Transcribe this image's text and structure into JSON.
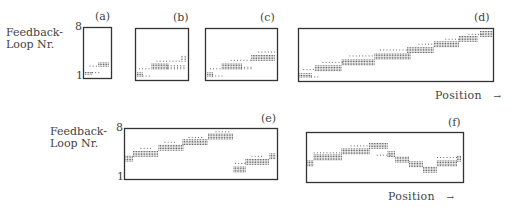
{
  "chart_data": {
    "type": "scatter",
    "title": "",
    "ylabel": "Feedback-Loop Nr.",
    "xlabel": "Position →",
    "ylim": [
      1,
      8
    ],
    "y_ticks": [
      "1",
      "8"
    ],
    "panels": [
      {
        "label": "(a)",
        "box": [
          83,
          27,
          28,
          51
        ],
        "blocks": [
          {
            "x0": 0.02,
            "x1": 0.3,
            "level": 0.05,
            "rows": 2,
            "dense": true
          },
          {
            "x0": 0.3,
            "x1": 0.65,
            "level": 0.08,
            "rows": 1,
            "dense": false
          },
          {
            "x0": 0.55,
            "x1": 0.98,
            "level": 0.22,
            "rows": 3,
            "dense": true
          },
          {
            "x0": 0.2,
            "x1": 0.5,
            "level": 0.22,
            "rows": 1,
            "dense": false
          }
        ]
      },
      {
        "label": "(b)",
        "box": [
          135,
          28,
          53,
          52
        ],
        "blocks": [
          {
            "x0": 0.01,
            "x1": 0.12,
            "level": 0.05,
            "rows": 3,
            "dense": true
          },
          {
            "x0": 0.12,
            "x1": 0.3,
            "level": 0.05,
            "rows": 1,
            "dense": false
          },
          {
            "x0": 0.05,
            "x1": 0.3,
            "level": 0.2,
            "rows": 1,
            "dense": false
          },
          {
            "x0": 0.3,
            "x1": 0.62,
            "level": 0.2,
            "rows": 4,
            "dense": true
          },
          {
            "x0": 0.62,
            "x1": 0.99,
            "level": 0.2,
            "rows": 3,
            "dense": false
          },
          {
            "x0": 0.4,
            "x1": 0.9,
            "level": 0.36,
            "rows": 1,
            "dense": false
          },
          {
            "x0": 0.9,
            "x1": 0.99,
            "level": 0.36,
            "rows": 4,
            "dense": false
          }
        ]
      },
      {
        "label": "(c)",
        "box": [
          205,
          28,
          72,
          52
        ],
        "blocks": [
          {
            "x0": 0.01,
            "x1": 0.08,
            "level": 0.05,
            "rows": 3,
            "dense": true
          },
          {
            "x0": 0.08,
            "x1": 0.25,
            "level": 0.05,
            "rows": 1,
            "dense": false
          },
          {
            "x0": 0.05,
            "x1": 0.22,
            "level": 0.2,
            "rows": 1,
            "dense": false
          },
          {
            "x0": 0.22,
            "x1": 0.5,
            "level": 0.2,
            "rows": 4,
            "dense": true
          },
          {
            "x0": 0.5,
            "x1": 0.68,
            "level": 0.2,
            "rows": 2,
            "dense": false
          },
          {
            "x0": 0.35,
            "x1": 0.65,
            "level": 0.38,
            "rows": 1,
            "dense": false
          },
          {
            "x0": 0.65,
            "x1": 0.99,
            "level": 0.38,
            "rows": 4,
            "dense": true
          },
          {
            "x0": 0.75,
            "x1": 0.99,
            "level": 0.55,
            "rows": 1,
            "dense": false
          }
        ]
      },
      {
        "label": "(d)",
        "box": [
          298,
          28,
          195,
          53
        ],
        "blocks": [
          {
            "x0": 0.0,
            "x1": 0.06,
            "level": 0.05,
            "rows": 3,
            "dense": true
          },
          {
            "x0": 0.06,
            "x1": 0.1,
            "level": 0.05,
            "rows": 1,
            "dense": false
          },
          {
            "x0": 0.02,
            "x1": 0.08,
            "level": 0.2,
            "rows": 1,
            "dense": false
          },
          {
            "x0": 0.08,
            "x1": 0.22,
            "level": 0.18,
            "rows": 4,
            "dense": true
          },
          {
            "x0": 0.12,
            "x1": 0.22,
            "level": 0.35,
            "rows": 1,
            "dense": false
          },
          {
            "x0": 0.22,
            "x1": 0.39,
            "level": 0.3,
            "rows": 4,
            "dense": true
          },
          {
            "x0": 0.26,
            "x1": 0.39,
            "level": 0.48,
            "rows": 1,
            "dense": false
          },
          {
            "x0": 0.39,
            "x1": 0.58,
            "level": 0.42,
            "rows": 4,
            "dense": true
          },
          {
            "x0": 0.42,
            "x1": 0.56,
            "level": 0.6,
            "rows": 1,
            "dense": false
          },
          {
            "x0": 0.56,
            "x1": 0.7,
            "level": 0.55,
            "rows": 4,
            "dense": true
          },
          {
            "x0": 0.62,
            "x1": 0.7,
            "level": 0.72,
            "rows": 1,
            "dense": false
          },
          {
            "x0": 0.7,
            "x1": 0.83,
            "level": 0.67,
            "rows": 4,
            "dense": true
          },
          {
            "x0": 0.76,
            "x1": 0.83,
            "level": 0.82,
            "rows": 1,
            "dense": false
          },
          {
            "x0": 0.83,
            "x1": 0.93,
            "level": 0.78,
            "rows": 4,
            "dense": true
          },
          {
            "x0": 0.88,
            "x1": 0.95,
            "level": 0.92,
            "rows": 1,
            "dense": false
          },
          {
            "x0": 0.94,
            "x1": 1.0,
            "level": 0.88,
            "rows": 4,
            "dense": true
          }
        ]
      },
      {
        "label": "(e)",
        "box": [
          124,
          128,
          153,
          51
        ],
        "blocks": [
          {
            "x0": 0.0,
            "x1": 0.05,
            "level": 0.35,
            "rows": 4,
            "dense": true
          },
          {
            "x0": 0.05,
            "x1": 0.22,
            "level": 0.45,
            "rows": 4,
            "dense": true
          },
          {
            "x0": 0.1,
            "x1": 0.18,
            "level": 0.62,
            "rows": 1,
            "dense": false
          },
          {
            "x0": 0.22,
            "x1": 0.38,
            "level": 0.58,
            "rows": 4,
            "dense": true
          },
          {
            "x0": 0.26,
            "x1": 0.34,
            "level": 0.75,
            "rows": 1,
            "dense": false
          },
          {
            "x0": 0.38,
            "x1": 0.55,
            "level": 0.7,
            "rows": 4,
            "dense": true
          },
          {
            "x0": 0.42,
            "x1": 0.52,
            "level": 0.85,
            "rows": 1,
            "dense": false
          },
          {
            "x0": 0.55,
            "x1": 0.72,
            "level": 0.82,
            "rows": 4,
            "dense": true
          },
          {
            "x0": 0.6,
            "x1": 0.7,
            "level": 0.97,
            "rows": 1,
            "dense": false
          },
          {
            "x0": 0.72,
            "x1": 0.8,
            "level": 0.12,
            "rows": 4,
            "dense": true
          },
          {
            "x0": 0.73,
            "x1": 0.8,
            "level": 0.3,
            "rows": 1,
            "dense": false
          },
          {
            "x0": 0.8,
            "x1": 0.96,
            "level": 0.28,
            "rows": 4,
            "dense": true
          },
          {
            "x0": 0.84,
            "x1": 0.92,
            "level": 0.45,
            "rows": 1,
            "dense": false
          },
          {
            "x0": 0.96,
            "x1": 1.0,
            "level": 0.4,
            "rows": 4,
            "dense": true
          }
        ]
      },
      {
        "label": "(f)",
        "box": [
          306,
          132,
          157,
          50
        ],
        "blocks": [
          {
            "x0": 0.0,
            "x1": 0.04,
            "level": 0.32,
            "rows": 4,
            "dense": true
          },
          {
            "x0": 0.04,
            "x1": 0.22,
            "level": 0.45,
            "rows": 4,
            "dense": true
          },
          {
            "x0": 0.04,
            "x1": 0.22,
            "level": 0.6,
            "rows": 1,
            "dense": false
          },
          {
            "x0": 0.22,
            "x1": 0.4,
            "level": 0.58,
            "rows": 4,
            "dense": true
          },
          {
            "x0": 0.28,
            "x1": 0.4,
            "level": 0.75,
            "rows": 1,
            "dense": false
          },
          {
            "x0": 0.4,
            "x1": 0.52,
            "level": 0.7,
            "rows": 4,
            "dense": true
          },
          {
            "x0": 0.45,
            "x1": 0.55,
            "level": 0.55,
            "rows": 1,
            "dense": false
          },
          {
            "x0": 0.52,
            "x1": 0.57,
            "level": 0.52,
            "rows": 4,
            "dense": true
          },
          {
            "x0": 0.57,
            "x1": 0.66,
            "level": 0.4,
            "rows": 4,
            "dense": true
          },
          {
            "x0": 0.66,
            "x1": 0.75,
            "level": 0.3,
            "rows": 4,
            "dense": true
          },
          {
            "x0": 0.75,
            "x1": 0.84,
            "level": 0.18,
            "rows": 4,
            "dense": true
          },
          {
            "x0": 0.84,
            "x1": 0.97,
            "level": 0.32,
            "rows": 4,
            "dense": true
          },
          {
            "x0": 0.84,
            "x1": 0.97,
            "level": 0.5,
            "rows": 1,
            "dense": false
          },
          {
            "x0": 0.97,
            "x1": 1.0,
            "level": 0.42,
            "rows": 4,
            "dense": true
          }
        ]
      }
    ]
  },
  "labels": {
    "ylabel_top_line1": "Feedback-",
    "ylabel_top_line2": "Loop Nr.",
    "ylabel_bottom_line1": "Feedback-",
    "ylabel_bottom_line2": "Loop Nr.",
    "tick_top_max": "8",
    "tick_top_min": "1",
    "tick_bottom_max": "8",
    "tick_bottom_min": "1",
    "panel_a": "(a)",
    "panel_b": "(b)",
    "panel_c": "(c)",
    "panel_d": "(d)",
    "panel_e": "(e)",
    "panel_f": "(f)",
    "xlabel_top": "Position",
    "xlabel_bottom": "Position",
    "arrow": "→"
  }
}
